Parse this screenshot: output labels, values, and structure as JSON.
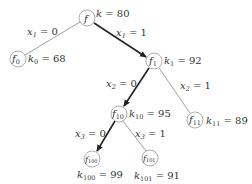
{
  "diagram": {
    "type": "decision-tree",
    "nodes": [
      {
        "id": "f",
        "name": "f",
        "sub": "",
        "k_label": "k",
        "k_sub": "",
        "k_value": "80",
        "cx": 87,
        "cy": 18
      },
      {
        "id": "f0",
        "name": "f",
        "sub": "0",
        "k_label": "k",
        "k_sub": "0",
        "k_value": "68",
        "cx": 18,
        "cy": 59
      },
      {
        "id": "f1",
        "name": "f",
        "sub": "1",
        "k_label": "k",
        "k_sub": "1",
        "k_value": "92",
        "cx": 154,
        "cy": 61
      },
      {
        "id": "f10",
        "name": "f",
        "sub": "10",
        "k_label": "k",
        "k_sub": "10",
        "k_value": "95",
        "cx": 119,
        "cy": 114
      },
      {
        "id": "f11",
        "name": "f",
        "sub": "11",
        "k_label": "k",
        "k_sub": "11",
        "k_value": "89",
        "cx": 195,
        "cy": 120
      },
      {
        "id": "f100",
        "name": "f",
        "sub": "100",
        "k_label": "k",
        "k_sub": "100",
        "k_value": "99",
        "cx": 92,
        "cy": 159
      },
      {
        "id": "f101",
        "name": "f",
        "sub": "101",
        "k_label": "k",
        "k_sub": "101",
        "k_value": "91",
        "cx": 150,
        "cy": 158
      }
    ],
    "edges": [
      {
        "from": "f",
        "to": "f0",
        "var": "x",
        "var_sub": "1",
        "value": "0",
        "bold": false
      },
      {
        "from": "f",
        "to": "f1",
        "var": "x",
        "var_sub": "1",
        "value": "1",
        "bold": true
      },
      {
        "from": "f1",
        "to": "f10",
        "var": "x",
        "var_sub": "2",
        "value": "0",
        "bold": true
      },
      {
        "from": "f1",
        "to": "f11",
        "var": "x",
        "var_sub": "2",
        "value": "1",
        "bold": false
      },
      {
        "from": "f10",
        "to": "f100",
        "var": "x",
        "var_sub": "3",
        "value": "0",
        "bold": true
      },
      {
        "from": "f10",
        "to": "f101",
        "var": "x",
        "var_sub": "3",
        "value": "1",
        "bold": false
      }
    ],
    "colors": {
      "bold_edge": "#222222",
      "thin_edge": "#777777",
      "node_stroke": "#8a8a8a",
      "text": "#333333"
    }
  }
}
